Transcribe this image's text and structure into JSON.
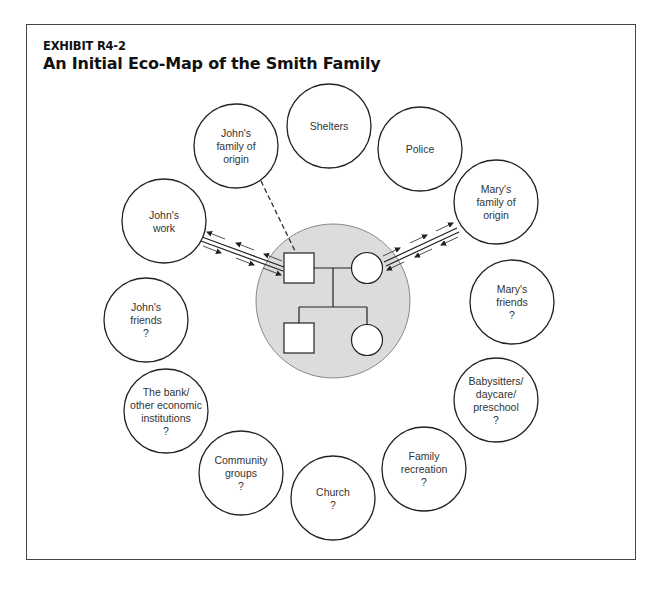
{
  "exhibit": {
    "label": "EXHIBIT R4-2",
    "title": "An Initial Eco-Map of the Smith Family"
  },
  "colors": {
    "stroke": "#222222",
    "family_fill": "#dcdcdc",
    "family_stroke": "#888888",
    "background": "#ffffff"
  },
  "family": {
    "name": "Smith Family",
    "members": [
      {
        "id": "john",
        "symbol": "square",
        "role": "father"
      },
      {
        "id": "mary",
        "symbol": "circle",
        "role": "mother"
      },
      {
        "id": "son",
        "symbol": "square",
        "role": "child"
      },
      {
        "id": "daughter",
        "symbol": "circle",
        "role": "child"
      }
    ]
  },
  "systems": [
    {
      "id": "shelters",
      "lines": [
        "Shelters"
      ]
    },
    {
      "id": "police",
      "lines": [
        "Police"
      ]
    },
    {
      "id": "johns-family-of-origin",
      "lines": [
        "John's",
        "family of",
        "origin"
      ]
    },
    {
      "id": "johns-work",
      "lines": [
        "John's",
        "work"
      ]
    },
    {
      "id": "marys-family-of-origin",
      "lines": [
        "Mary's",
        "family of",
        "origin"
      ]
    },
    {
      "id": "johns-friends",
      "lines": [
        "John's",
        "friends",
        "?"
      ]
    },
    {
      "id": "marys-friends",
      "lines": [
        "Mary's",
        "friends",
        "?"
      ]
    },
    {
      "id": "bank",
      "lines": [
        "The bank/",
        "other economic",
        "institutions",
        "?"
      ]
    },
    {
      "id": "babysitters",
      "lines": [
        "Babysitters/",
        "daycare/",
        "preschool",
        "?"
      ]
    },
    {
      "id": "community-groups",
      "lines": [
        "Community",
        "groups",
        "?"
      ]
    },
    {
      "id": "church",
      "lines": [
        "Church",
        "?"
      ]
    },
    {
      "id": "family-recreation",
      "lines": [
        "Family",
        "recreation",
        "?"
      ]
    }
  ],
  "connections": [
    {
      "from": "johns-family-of-origin",
      "to": "john",
      "type": "tenuous (dashed)"
    },
    {
      "from": "johns-work",
      "to": "john",
      "type": "strong, bidirectional energy flow"
    },
    {
      "from": "marys-family-of-origin",
      "to": "mary",
      "type": "strong, bidirectional energy flow"
    }
  ]
}
